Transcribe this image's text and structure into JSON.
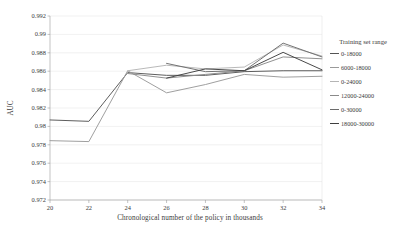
{
  "chart_data": {
    "type": "line",
    "title": "",
    "xlabel": "Chronological number of the policy in thousands",
    "ylabel": "AUC",
    "xlim": [
      20,
      34
    ],
    "ylim": [
      0.972,
      0.992
    ],
    "xticks": [
      "20",
      "22",
      "24",
      "26",
      "28",
      "30",
      "32",
      "34"
    ],
    "yticks": [
      "0.992",
      "0.99",
      "0.988",
      "0.986",
      "0.984",
      "0.982",
      "0.98",
      "0.978",
      "0.976",
      "0.974",
      "0.972"
    ],
    "grid": true,
    "legend_position": "right",
    "legend_title": "Training set range",
    "series": [
      {
        "name": "0-18000",
        "color": "#545454",
        "x": [
          20,
          22,
          24,
          26,
          28,
          30,
          32,
          34
        ],
        "values": [
          0.9807,
          0.98055,
          0.98585,
          0.98555,
          0.98555,
          0.98595,
          0.98605,
          0.98605
        ]
      },
      {
        "name": "6000-18000",
        "color": "#9a9a9a",
        "x": [
          20,
          22,
          24,
          26,
          28,
          30,
          32,
          34
        ],
        "values": [
          0.97845,
          0.97835,
          0.98605,
          0.98365,
          0.98455,
          0.98565,
          0.98535,
          0.98545
        ]
      },
      {
        "name": "0-24000",
        "color": "#b5b5b5",
        "x": [
          24,
          26,
          28,
          30,
          32,
          34
        ],
        "values": [
          0.98605,
          0.98665,
          0.98625,
          0.98645,
          0.98885,
          0.98765
        ]
      },
      {
        "name": "12000-24000",
        "color": "#8a8a8a",
        "x": [
          24,
          26,
          28,
          30,
          32,
          34
        ],
        "values": [
          0.98575,
          0.98525,
          0.98565,
          0.98605,
          0.98755,
          0.98735
        ]
      },
      {
        "name": "0-30000",
        "color": "#6b6b6b",
        "x": [
          26,
          28,
          30,
          32,
          34
        ],
        "values": [
          0.98685,
          0.98595,
          0.98605,
          0.98905,
          0.98755
        ]
      },
      {
        "name": "18000-30000",
        "color": "#3f3f3f",
        "x": [
          26,
          28,
          30,
          32,
          34
        ],
        "values": [
          0.98525,
          0.98625,
          0.98605,
          0.98805,
          0.98615
        ]
      }
    ]
  }
}
